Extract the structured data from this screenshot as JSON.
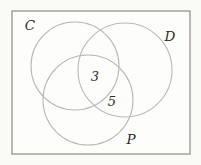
{
  "diagram": {
    "type": "venn-diagram",
    "colors": {
      "page_background": "#fafaf6",
      "frame_stroke": "#8b8b88",
      "frame_fill": "#fdfdfb",
      "circle_stroke": "#b9b9b6",
      "text": "#2b2b28"
    },
    "frame": {
      "x": 12,
      "y": 11,
      "w": 178,
      "h": 143
    },
    "sets": [
      {
        "label": "C",
        "cx": 75,
        "cy": 66,
        "r": 44,
        "label_x": 30,
        "label_y": 30
      },
      {
        "label": "D",
        "cx": 125,
        "cy": 70,
        "r": 47,
        "label_x": 170,
        "label_y": 41
      },
      {
        "label": "P",
        "cx": 88,
        "cy": 100,
        "r": 45,
        "label_x": 131,
        "label_y": 144
      }
    ],
    "region_values": [
      {
        "value": "3",
        "region": "C∩D∩P",
        "x": 95,
        "y": 81
      },
      {
        "value": "5",
        "region": "D∩P",
        "x": 112,
        "y": 106
      }
    ]
  }
}
